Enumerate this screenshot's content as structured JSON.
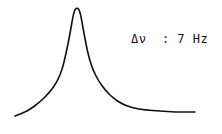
{
  "annotation": {
    "symbol": "Δν",
    "separator": ":",
    "value": "7 Hz",
    "text": "Δν  : 7 Hz"
  },
  "line_color": "#111111",
  "background": "#ffffff",
  "chart_data": {
    "type": "line",
    "title": "",
    "xlabel": "",
    "ylabel": "",
    "annotations": [
      "Δν : 7 Hz"
    ],
    "grid": false,
    "legend": null,
    "points_px": [
      [
        15,
        116
      ],
      [
        28,
        111
      ],
      [
        40,
        102
      ],
      [
        50,
        92
      ],
      [
        57,
        82
      ],
      [
        62,
        70
      ],
      [
        65,
        58
      ],
      [
        68,
        44
      ],
      [
        71,
        28
      ],
      [
        73,
        16
      ],
      [
        75,
        9
      ],
      [
        77,
        8
      ],
      [
        79,
        9
      ],
      [
        81,
        16
      ],
      [
        83,
        28
      ],
      [
        86,
        44
      ],
      [
        89,
        58
      ],
      [
        93,
        70
      ],
      [
        98,
        80
      ],
      [
        105,
        90
      ],
      [
        113,
        98
      ],
      [
        122,
        104
      ],
      [
        133,
        108
      ],
      [
        145,
        110
      ],
      [
        160,
        111
      ],
      [
        175,
        112
      ],
      [
        195,
        112
      ]
    ]
  }
}
